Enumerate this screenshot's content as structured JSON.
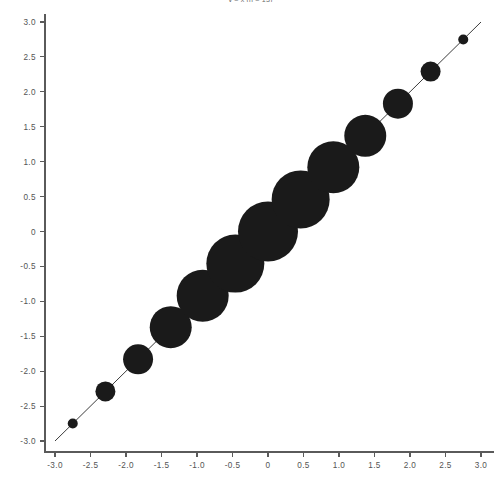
{
  "chart_data": {
    "type": "scatter",
    "title": "y = x  (n = 13)",
    "xlabel": "",
    "ylabel": "",
    "xlim": [
      -3.0,
      3.0
    ],
    "ylim": [
      -3.0,
      3.0
    ],
    "grid": false,
    "legend": "none",
    "xticks": [
      "-3.0",
      "-2.5",
      "-2.0",
      "-1.5",
      "-1.0",
      "-0.5",
      "0",
      "0.5",
      "1.0",
      "1.5",
      "2.0",
      "2.5",
      "3.0"
    ],
    "xtick_values": [
      -3.0,
      -2.5,
      -2.0,
      -1.5,
      -1.0,
      -0.5,
      0,
      0.5,
      1.0,
      1.5,
      2.0,
      2.5,
      3.0
    ],
    "yticks": [
      "3.0",
      "2.5",
      "2.0",
      "1.5",
      "1.0",
      "0.5",
      "0",
      "-0.5",
      "-1.0",
      "-1.5",
      "-2.0",
      "-2.5",
      "-3.0"
    ],
    "ytick_values": [
      3.0,
      2.5,
      2.0,
      1.5,
      1.0,
      0.5,
      0,
      -0.5,
      -1.0,
      -1.5,
      -2.0,
      -2.5,
      -3.0
    ],
    "marker_color": "#1a1a1a",
    "line_color": "#3c3c3c",
    "axis_color": "#5a5a5a",
    "series": [
      {
        "name": "bubbles",
        "x": [
          -2.75,
          -2.29,
          -1.83,
          -1.37,
          -0.92,
          -0.46,
          0.0,
          0.46,
          0.92,
          1.37,
          1.83,
          2.29,
          2.75
        ],
        "y": [
          -2.75,
          -2.29,
          -1.83,
          -1.37,
          -0.92,
          -0.46,
          0.0,
          0.46,
          0.92,
          1.37,
          1.83,
          2.29,
          2.75
        ],
        "sizes": [
          5,
          10,
          15,
          21,
          26,
          29,
          30,
          29,
          26,
          21,
          15,
          10,
          5
        ]
      }
    ],
    "trendline": {
      "from": [
        -3.0,
        -3.0
      ],
      "to": [
        3.0,
        3.0
      ]
    }
  }
}
